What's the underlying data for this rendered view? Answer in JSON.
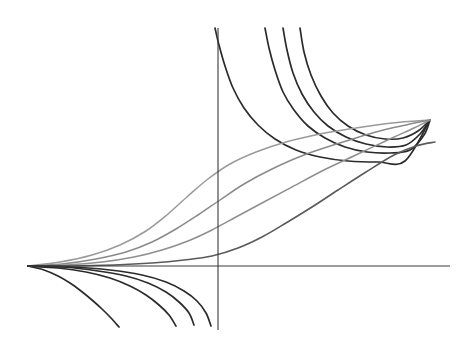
{
  "figure": {
    "title": "",
    "background_color": "#ffffff",
    "width": 471,
    "height": 346
  },
  "axes": {
    "x_axis": {
      "name": "horizontal-axis",
      "color": "#3a3a3a",
      "stroke_width": 1.1,
      "y_pixel": 266,
      "x_start_pixel": 28,
      "x_end_pixel": 450,
      "label": "",
      "ticks": []
    },
    "y_axis": {
      "name": "vertical-axis",
      "color": "#3a3a3a",
      "stroke_width": 1.1,
      "x_pixel": 218,
      "y_start_pixel": 28,
      "y_end_pixel": 330,
      "label": "",
      "ticks": []
    },
    "origin_pixel": [
      218,
      266
    ],
    "grid": false,
    "legend": null
  },
  "chart_data": {
    "type": "line",
    "title": "",
    "xlabel": "",
    "ylabel": "",
    "grid": false,
    "legend_position": "none",
    "xlim": [
      -4.9,
      5.6
    ],
    "ylim": [
      -1.75,
      3.05
    ],
    "annotations": [],
    "common_nodes": {
      "left_node_pixel": [
        28,
        266
      ],
      "right_node_pixel": [
        430,
        120
      ]
    },
    "series": [
      {
        "name": "upper-branch-1",
        "group": "upper",
        "color": "#2b2b2b",
        "stroke_width": 1.7,
        "points_pixel": [
          [
            215,
            28
          ],
          [
            219,
            45
          ],
          [
            225,
            66
          ],
          [
            233,
            88
          ],
          [
            244,
            108
          ],
          [
            258,
            125
          ],
          [
            275,
            139
          ],
          [
            296,
            150
          ],
          [
            320,
            157
          ],
          [
            348,
            161
          ],
          [
            378,
            162
          ],
          [
            405,
            161
          ],
          [
            430,
            120
          ]
        ]
      },
      {
        "name": "upper-branch-2",
        "group": "upper",
        "color": "#2b2b2b",
        "stroke_width": 1.7,
        "points_pixel": [
          [
            265,
            28
          ],
          [
            269,
            48
          ],
          [
            275,
            70
          ],
          [
            283,
            92
          ],
          [
            294,
            110
          ],
          [
            308,
            126
          ],
          [
            325,
            138
          ],
          [
            345,
            147
          ],
          [
            367,
            152
          ],
          [
            390,
            153
          ],
          [
            410,
            150
          ],
          [
            424,
            135
          ],
          [
            430,
            120
          ]
        ]
      },
      {
        "name": "upper-branch-3",
        "group": "upper",
        "color": "#2b2b2b",
        "stroke_width": 1.7,
        "points_pixel": [
          [
            283,
            28
          ],
          [
            287,
            50
          ],
          [
            293,
            73
          ],
          [
            302,
            94
          ],
          [
            314,
            112
          ],
          [
            328,
            126
          ],
          [
            346,
            137
          ],
          [
            366,
            144
          ],
          [
            387,
            147
          ],
          [
            406,
            145
          ],
          [
            420,
            134
          ],
          [
            430,
            120
          ]
        ]
      },
      {
        "name": "upper-branch-4",
        "group": "upper",
        "color": "#2b2b2b",
        "stroke_width": 1.7,
        "points_pixel": [
          [
            300,
            28
          ],
          [
            304,
            52
          ],
          [
            311,
            75
          ],
          [
            321,
            96
          ],
          [
            333,
            113
          ],
          [
            348,
            126
          ],
          [
            366,
            135
          ],
          [
            385,
            139
          ],
          [
            403,
            138
          ],
          [
            418,
            131
          ],
          [
            430,
            120
          ]
        ]
      },
      {
        "name": "sigmoid-1-lightest",
        "group": "middle",
        "color": "#9a9a9a",
        "stroke_width": 1.5,
        "points_pixel": [
          [
            28,
            266
          ],
          [
            60,
            262
          ],
          [
            92,
            255
          ],
          [
            120,
            245
          ],
          [
            146,
            231
          ],
          [
            168,
            214
          ],
          [
            188,
            196
          ],
          [
            208,
            179
          ],
          [
            230,
            164
          ],
          [
            256,
            152
          ],
          [
            286,
            142
          ],
          [
            320,
            134
          ],
          [
            356,
            128
          ],
          [
            392,
            123
          ],
          [
            430,
            120
          ]
        ]
      },
      {
        "name": "sigmoid-2",
        "group": "middle",
        "color": "#8a8a8a",
        "stroke_width": 1.5,
        "points_pixel": [
          [
            28,
            266
          ],
          [
            62,
            264
          ],
          [
            96,
            259
          ],
          [
            126,
            252
          ],
          [
            152,
            242
          ],
          [
            176,
            229
          ],
          [
            198,
            215
          ],
          [
            220,
            200
          ],
          [
            244,
            184
          ],
          [
            272,
            169
          ],
          [
            304,
            155
          ],
          [
            340,
            143
          ],
          [
            376,
            132
          ],
          [
            406,
            125
          ],
          [
            430,
            120
          ]
        ]
      },
      {
        "name": "sigmoid-3",
        "group": "middle",
        "color": "#8f8f8f",
        "stroke_width": 1.5,
        "points_pixel": [
          [
            28,
            266
          ],
          [
            66,
            265
          ],
          [
            102,
            262
          ],
          [
            134,
            257
          ],
          [
            162,
            250
          ],
          [
            188,
            241
          ],
          [
            212,
            230
          ],
          [
            236,
            217
          ],
          [
            262,
            203
          ],
          [
            292,
            187
          ],
          [
            324,
            170
          ],
          [
            358,
            154
          ],
          [
            392,
            138
          ],
          [
            414,
            128
          ],
          [
            430,
            120
          ]
        ]
      },
      {
        "name": "sigmoid-4-darkest",
        "group": "middle",
        "color": "#5a5a5a",
        "stroke_width": 1.6,
        "points_pixel": [
          [
            28,
            266
          ],
          [
            72,
            266
          ],
          [
            114,
            265
          ],
          [
            152,
            263
          ],
          [
            184,
            260
          ],
          [
            212,
            256
          ],
          [
            238,
            248
          ],
          [
            262,
            237
          ],
          [
            286,
            223
          ],
          [
            312,
            207
          ],
          [
            338,
            190
          ],
          [
            366,
            172
          ],
          [
            394,
            155
          ],
          [
            416,
            146
          ],
          [
            435,
            142
          ]
        ]
      },
      {
        "name": "lower-branch-1",
        "group": "lower",
        "color": "#2b2b2b",
        "stroke_width": 1.7,
        "points_pixel": [
          [
            28,
            266
          ],
          [
            44,
            270
          ],
          [
            58,
            276
          ],
          [
            70,
            283
          ],
          [
            81,
            291
          ],
          [
            92,
            300
          ],
          [
            102,
            309
          ],
          [
            111,
            318
          ],
          [
            119,
            327
          ]
        ]
      },
      {
        "name": "lower-branch-2",
        "group": "lower",
        "color": "#2b2b2b",
        "stroke_width": 1.7,
        "points_pixel": [
          [
            28,
            266
          ],
          [
            58,
            268
          ],
          [
            86,
            272
          ],
          [
            110,
            278
          ],
          [
            130,
            286
          ],
          [
            146,
            295
          ],
          [
            159,
            305
          ],
          [
            169,
            315
          ],
          [
            176,
            326
          ]
        ]
      },
      {
        "name": "lower-branch-3",
        "group": "lower",
        "color": "#2b2b2b",
        "stroke_width": 1.7,
        "points_pixel": [
          [
            28,
            266
          ],
          [
            64,
            267
          ],
          [
            98,
            271
          ],
          [
            126,
            276
          ],
          [
            148,
            283
          ],
          [
            166,
            292
          ],
          [
            179,
            302
          ],
          [
            189,
            313
          ],
          [
            194,
            325
          ]
        ]
      },
      {
        "name": "lower-branch-4",
        "group": "lower",
        "color": "#2b2b2b",
        "stroke_width": 1.7,
        "points_pixel": [
          [
            28,
            266
          ],
          [
            70,
            267
          ],
          [
            110,
            270
          ],
          [
            142,
            275
          ],
          [
            166,
            282
          ],
          [
            184,
            291
          ],
          [
            197,
            301
          ],
          [
            206,
            313
          ],
          [
            211,
            326
          ]
        ]
      }
    ]
  }
}
